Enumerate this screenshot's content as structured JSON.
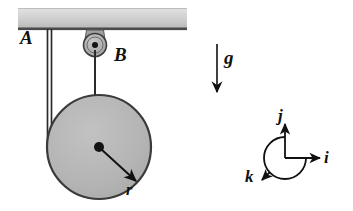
{
  "figure": {
    "width": 353,
    "height": 211,
    "background_color": "#ffffff"
  },
  "labels": {
    "cord_a": "A",
    "pulley_b": "B",
    "radius": "r",
    "gravity": "g",
    "unit_i": "i",
    "unit_j": "j",
    "unit_k": "k"
  },
  "colors": {
    "ink": "#111111",
    "ceiling_light": "#d8d8d8",
    "ceiling_dark": "#a8a8a8",
    "disk_fill": "#b6b6b6",
    "disk_stroke": "#3a3a3a",
    "pulley_fill": "#b0b0b0",
    "bracket_fill": "#9d9d9d"
  },
  "geometry": {
    "ceiling": {
      "x": 18,
      "y": 8,
      "width": 169,
      "height": 22
    },
    "cord_a": {
      "x1": 47,
      "x2": 51,
      "y_top": 30,
      "y_bottom": 140
    },
    "pulley_b": {
      "cx": 95,
      "cy": 45,
      "r": 11,
      "hub_r": 3
    },
    "cord_b": {
      "x": 95,
      "y_top": 52,
      "y_bottom": 147
    },
    "disk": {
      "cx": 99,
      "cy": 147,
      "r": 52,
      "hub_r": 5
    },
    "radius_arrow": {
      "x1": 99,
      "y1": 147,
      "x2": 136,
      "y2": 182
    },
    "gravity_arrow": {
      "x": 217,
      "y_top": 44,
      "y_bottom": 94
    },
    "triad": {
      "ox": 285,
      "oy": 158,
      "i_end_x": 322,
      "j_end_y": 122,
      "k_end_x": 258,
      "k_end_y": 180,
      "arc_r": 21
    }
  }
}
